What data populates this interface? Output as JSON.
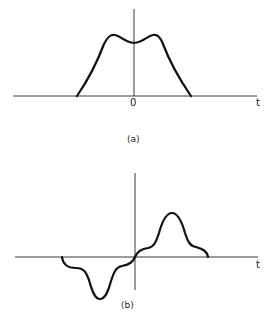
{
  "figures": [
    {
      "caption": "(a)",
      "x_axis_label": "t",
      "origin_label": "0",
      "description": "Symmetric pulse with two humps and a central dip"
    },
    {
      "caption": "(b)",
      "x_axis_label": "t",
      "description": "Odd-symmetric waveform: negative lobe for t<0, positive lobe for t>0"
    }
  ]
}
